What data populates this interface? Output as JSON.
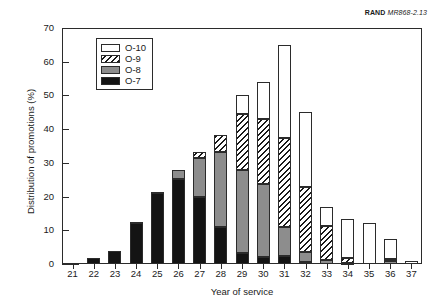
{
  "source_tag": {
    "bold": "RAND",
    "italic": "MR868-2.13"
  },
  "chart_data": {
    "type": "bar",
    "subtype": "stacked-vertical",
    "title": "",
    "xlabel": "Year of service",
    "ylabel": "Distribution of promotions (%)",
    "xlim": [
      20.5,
      37.5
    ],
    "ylim": [
      0,
      70
    ],
    "yticks": [
      0,
      10,
      20,
      30,
      40,
      50,
      60,
      70
    ],
    "grid": false,
    "legend_position": "upper-left-inside",
    "categories": [
      21,
      22,
      23,
      24,
      25,
      26,
      27,
      28,
      29,
      30,
      31,
      32,
      33,
      34,
      35,
      36,
      37
    ],
    "series": [
      {
        "name": "O-7",
        "color": "#141414",
        "pattern": "solid-black",
        "values": [
          0.4,
          1.9,
          3.8,
          12.2,
          21.2,
          25.2,
          19.8,
          11.0,
          3.3,
          2.2,
          2.3,
          0.5,
          0.0,
          0.0,
          0.0,
          0.0,
          0.0
        ]
      },
      {
        "name": "O-8",
        "color": "#8d8d8d",
        "pattern": "solid-gray",
        "values": [
          0.0,
          0.0,
          0.0,
          0.3,
          0.3,
          2.8,
          11.6,
          22.2,
          24.5,
          21.5,
          8.7,
          3.2,
          1.2,
          0.3,
          0.0,
          0.8,
          0.0
        ]
      },
      {
        "name": "O-9",
        "color": "#ffffff",
        "pattern": "diagonal-hatch",
        "values": [
          0.0,
          0.0,
          0.0,
          0.0,
          0.0,
          0.0,
          1.9,
          5.2,
          16.6,
          19.3,
          26.5,
          19.1,
          10.1,
          1.6,
          0.0,
          0.6,
          0.0
        ]
      },
      {
        "name": "O-10",
        "color": "#ffffff",
        "pattern": "solid-white",
        "values": [
          0.0,
          0.0,
          0.0,
          0.0,
          0.0,
          0.0,
          0.0,
          0.0,
          5.6,
          11.0,
          27.5,
          22.2,
          5.7,
          11.5,
          12.3,
          6.1,
          0.8
        ]
      }
    ],
    "totals": [
      0.4,
      1.9,
      3.8,
      12.5,
      21.5,
      28.0,
      33.3,
      38.4,
      50.0,
      54.0,
      65.0,
      45.0,
      17.0,
      13.4,
      12.3,
      7.5,
      0.8
    ]
  }
}
